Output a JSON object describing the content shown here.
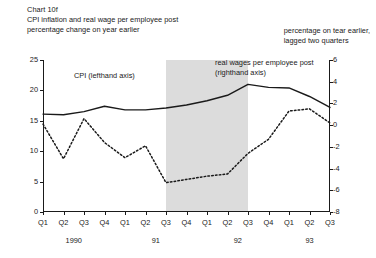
{
  "header": {
    "chart_number": "Chart 10f",
    "title": "CPI inflation and real wage per employee post",
    "subtitle": "percentage change on year earlier",
    "right_note_line_1": "percentage on tear earlier,",
    "right_note_line_2": "lagged two quarters"
  },
  "annotations": {
    "cpi": "CPI (lefthand axis)",
    "real_wages_line_1": "real wages per employee post",
    "real_wages_line_2": "(righthand axis)"
  },
  "colors": {
    "ink": "#1a1a1a",
    "shading": "#dcdcdc",
    "background": "#ffffff"
  },
  "chart_data": {
    "type": "line",
    "title": "CPI inflation and real wage per employee post",
    "subtitle": "percentage change on year earlier",
    "xlabel": "",
    "ylabel": "percentage change on year earlier",
    "y2label": "percentage on tear earlier, lagged two quarters",
    "grid": false,
    "legend_position": "inline-annotations",
    "x": [
      "Q1",
      "Q2",
      "Q3",
      "Q4",
      "Q1",
      "Q2",
      "Q3",
      "Q4",
      "Q1",
      "Q2",
      "Q3",
      "Q4",
      "Q1",
      "Q2",
      "Q3"
    ],
    "x_tick_labels": [
      "Q1",
      "Q2",
      "Q3",
      "Q4",
      "Q1",
      "Q2",
      "Q3",
      "Q4",
      "Q1",
      "Q2",
      "Q3",
      "Q4",
      "Q1",
      "Q2",
      "Q3"
    ],
    "year_groups": [
      {
        "label": "1990",
        "start_index": 0,
        "end_index": 3
      },
      {
        "label": "91",
        "start_index": 4,
        "end_index": 7
      },
      {
        "label": "92",
        "start_index": 8,
        "end_index": 11
      },
      {
        "label": "93",
        "start_index": 12,
        "end_index": 14
      }
    ],
    "ylim": [
      0,
      25
    ],
    "yticks": [
      0,
      5,
      10,
      15,
      20,
      25
    ],
    "ytick_labels": [
      "0",
      "5",
      "10",
      "15",
      "20",
      "25"
    ],
    "y2lim": [
      -8,
      6
    ],
    "y2ticks": [
      -8,
      -6,
      -4,
      -2,
      0,
      2,
      4,
      6
    ],
    "y2tick_labels": [
      "-8",
      "-6",
      "-4",
      "-2",
      "0",
      "2",
      "4",
      "6"
    ],
    "shaded_region": {
      "start_index": 6,
      "end_index": 10,
      "start_label": "Q3 91",
      "end_label": "Q3 92"
    },
    "series": [
      {
        "name": "CPI (lefthand axis)",
        "axis": "left",
        "style": "solid",
        "values": [
          16.1,
          16.0,
          16.5,
          17.4,
          16.8,
          16.8,
          17.1,
          17.6,
          18.3,
          19.2,
          21.0,
          20.5,
          20.4,
          19.0,
          17.2
        ]
      },
      {
        "name": "real wages per employee post (righthand axis)",
        "axis": "right",
        "style": "dotted",
        "values": [
          0.1,
          -3.1,
          0.6,
          -1.6,
          -3.0,
          -1.9,
          -5.3,
          -5.0,
          -4.7,
          -4.5,
          -2.6,
          -1.3,
          1.3,
          1.5,
          0.2
        ]
      }
    ],
    "series_right_in_left_units": [
      15.5,
      9.9,
      16.8,
      11.4,
      9.9,
      11.9,
      6.3,
      6.8,
      7.2,
      7.4,
      10.5,
      12.8,
      17.4,
      17.8,
      15.5
    ]
  }
}
